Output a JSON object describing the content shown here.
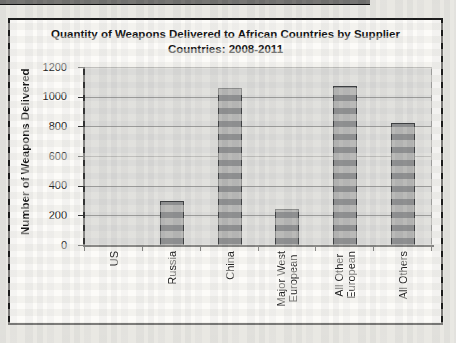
{
  "scan": {
    "artifact_strip_color": "#0d0d0d",
    "page_background": "#e9e8e3"
  },
  "chart_data": {
    "type": "bar",
    "title": "Quantity of Weapons Delivered to African Countries by Supplier Countries: 2008-2011",
    "title_lines": [
      "Quantity of Weapons Delivered to African Countries by Supplier",
      "Countries: 2008-2011"
    ],
    "xlabel": "",
    "ylabel": "Number of Weapons Delivered",
    "categories": [
      "US",
      "Russia",
      "China",
      "Major West\nEuropean",
      "All Other\nEuropean",
      "All Others"
    ],
    "values": [
      0,
      300,
      1060,
      240,
      1070,
      820
    ],
    "ylim": [
      0,
      1200
    ],
    "yticks": [
      0,
      200,
      400,
      600,
      800,
      1000,
      1200
    ],
    "grid": "horizontal",
    "legend": "none",
    "category_label_rotation": "90deg-bottom-to-top",
    "colors": {
      "bar_fill": "#8f9091",
      "bar_border": "#3d3f41",
      "plot_background": "#dbdbd9",
      "gridline": "#9b9b99",
      "axis": "#333333",
      "chart_background": "#fcfbf8",
      "text": "#222222"
    }
  }
}
